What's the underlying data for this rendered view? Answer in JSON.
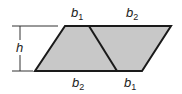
{
  "diagram": {
    "type": "parallelogram-composition",
    "colors": {
      "fill": "#c8c8c8",
      "stroke": "#1a1a1a",
      "text": "#222222"
    },
    "shapes": {
      "left_trapezoid": {
        "points": "65,26 89,26 117,71 35,71"
      },
      "right_trapezoid": {
        "points": "89,26 171,26 142,71 117,71"
      },
      "divider": {
        "x1": 89,
        "y1": 26,
        "x2": 117,
        "y2": 71
      }
    },
    "labels": {
      "top_left": {
        "base": "b",
        "sub": "1"
      },
      "top_right": {
        "base": "b",
        "sub": "2"
      },
      "bottom_left": {
        "base": "b",
        "sub": "2"
      },
      "bottom_right": {
        "base": "b",
        "sub": "1"
      },
      "height": "h"
    }
  }
}
